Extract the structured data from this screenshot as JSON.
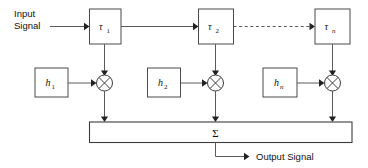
{
  "diagram": {
    "type": "signal-flow-block-diagram",
    "background_color": "#ffffff",
    "line_color": "#5a5a5a",
    "box_stroke_color": "#4a4a4a",
    "text_color": "#111111",
    "input": {
      "label_line1": "Input",
      "label_line2": "Signal"
    },
    "output": {
      "label": "Output Signal"
    },
    "delay_blocks": [
      {
        "name": "delay-1",
        "symbol": "τ",
        "subscript": "1",
        "subscript_italic": false
      },
      {
        "name": "delay-2",
        "symbol": "τ",
        "subscript": "2",
        "subscript_italic": false
      },
      {
        "name": "delay-n",
        "symbol": "τ",
        "subscript": "n",
        "subscript_italic": true
      }
    ],
    "coefficient_blocks": [
      {
        "name": "coefficient-1",
        "symbol": "h",
        "subscript": "1",
        "subscript_italic": false
      },
      {
        "name": "coefficient-2",
        "symbol": "h",
        "subscript": "2",
        "subscript_italic": false
      },
      {
        "name": "coefficient-n",
        "symbol": "h",
        "subscript": "n",
        "subscript_italic": true
      }
    ],
    "multipliers": [
      {
        "name": "multiplier-1",
        "glyph": "⊗"
      },
      {
        "name": "multiplier-2",
        "glyph": "⊗"
      },
      {
        "name": "multiplier-n",
        "glyph": "⊗"
      }
    ],
    "summer": {
      "label": "Σ"
    },
    "continuation": {
      "style": "dashed",
      "meaning": "repeated stages between delay 2 and delay n"
    }
  }
}
